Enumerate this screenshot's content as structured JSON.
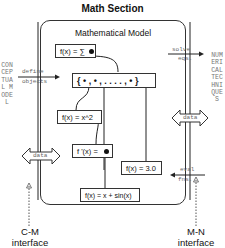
{
  "title": "Math Section",
  "model": {
    "title": "Mathematical Model",
    "boxes": {
      "sum": "f(x) = ∑",
      "set": "{ • , • , . . . . , • }",
      "square": "f(x) = x^2",
      "derivative": "f '(x) = ",
      "constant": "f(x) = 3.0",
      "sine": "f(x) = x + sin(x)"
    }
  },
  "arrows": {
    "define": "define",
    "objects": "objects",
    "solve": "solve",
    "eqs": "eqs.",
    "eval": "eval",
    "fns": "fns.",
    "data_left": "data",
    "data_right": "data"
  },
  "side_labels": {
    "left": "CONCEPTUAL MODEL",
    "right": "NUMERICAL TECHNIQUES"
  },
  "interfaces": {
    "left": {
      "line1": "C-M",
      "line2": "interface"
    },
    "right": {
      "line1": "M-N",
      "line2": "interface"
    }
  }
}
